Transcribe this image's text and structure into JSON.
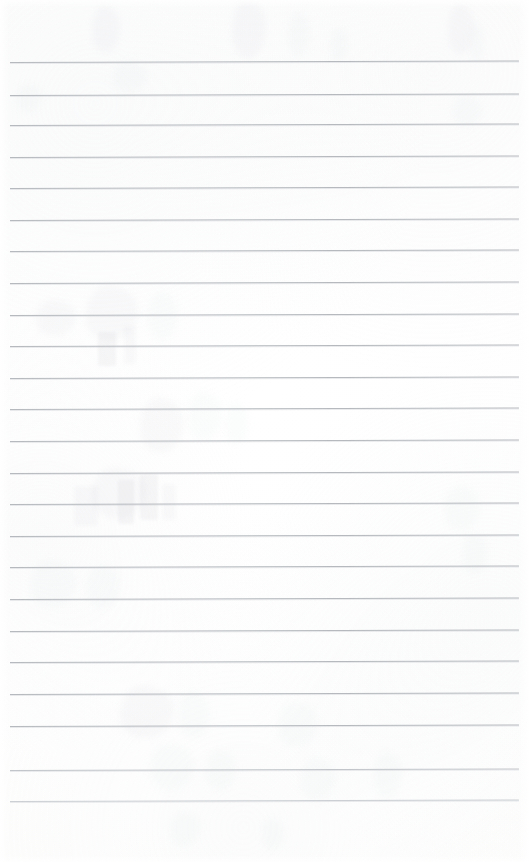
{
  "document": {
    "kind": "lined-notebook-page-scan",
    "title": "Blank Ruled Notebook Page",
    "page_width": 529,
    "page_height": 862,
    "paper_color": "#ffffff",
    "rule_color": "#b6babe",
    "content_text": "",
    "has_handwriting": false,
    "notes": "Blank ruled sheet; only faint bleed-through shadows from the reverse side are visible."
  },
  "ruling": {
    "line_count": 24,
    "first_line_y": 62,
    "last_line_y": 801,
    "spacing_px": 32.1,
    "left_margin_x": 10,
    "right_edge_x": 519,
    "line_thickness_px": 1,
    "skew_px_across_page": -1.5,
    "lines": [
      {
        "index": 1,
        "y": 62,
        "x_start": 10,
        "x_end": 519,
        "weight": "normal"
      },
      {
        "index": 2,
        "y": 95,
        "x_start": 10,
        "x_end": 519,
        "weight": "normal"
      },
      {
        "index": 3,
        "y": 125,
        "x_start": 10,
        "x_end": 519,
        "weight": "normal"
      },
      {
        "index": 4,
        "y": 157,
        "x_start": 10,
        "x_end": 519,
        "weight": "normal"
      },
      {
        "index": 5,
        "y": 188,
        "x_start": 10,
        "x_end": 519,
        "weight": "normal"
      },
      {
        "index": 6,
        "y": 220,
        "x_start": 10,
        "x_end": 519,
        "weight": "normal"
      },
      {
        "index": 7,
        "y": 251,
        "x_start": 10,
        "x_end": 519,
        "weight": "normal"
      },
      {
        "index": 8,
        "y": 283,
        "x_start": 10,
        "x_end": 519,
        "weight": "normal"
      },
      {
        "index": 9,
        "y": 315,
        "x_start": 10,
        "x_end": 519,
        "weight": "normal"
      },
      {
        "index": 10,
        "y": 346,
        "x_start": 10,
        "x_end": 519,
        "weight": "normal"
      },
      {
        "index": 11,
        "y": 378,
        "x_start": 10,
        "x_end": 519,
        "weight": "normal"
      },
      {
        "index": 12,
        "y": 409,
        "x_start": 10,
        "x_end": 519,
        "weight": "normal"
      },
      {
        "index": 13,
        "y": 441,
        "x_start": 10,
        "x_end": 519,
        "weight": "normal"
      },
      {
        "index": 14,
        "y": 473,
        "x_start": 10,
        "x_end": 519,
        "weight": "normal"
      },
      {
        "index": 15,
        "y": 504,
        "x_start": 10,
        "x_end": 519,
        "weight": "normal"
      },
      {
        "index": 16,
        "y": 536,
        "x_start": 10,
        "x_end": 519,
        "weight": "normal"
      },
      {
        "index": 17,
        "y": 567,
        "x_start": 10,
        "x_end": 519,
        "weight": "normal"
      },
      {
        "index": 18,
        "y": 599,
        "x_start": 10,
        "x_end": 519,
        "weight": "normal"
      },
      {
        "index": 19,
        "y": 631,
        "x_start": 10,
        "x_end": 519,
        "weight": "normal"
      },
      {
        "index": 20,
        "y": 662,
        "x_start": 10,
        "x_end": 519,
        "weight": "normal"
      },
      {
        "index": 21,
        "y": 694,
        "x_start": 10,
        "x_end": 519,
        "weight": "normal"
      },
      {
        "index": 22,
        "y": 726,
        "x_start": 10,
        "x_end": 519,
        "weight": "normal"
      },
      {
        "index": 23,
        "y": 770,
        "x_start": 10,
        "x_end": 519,
        "weight": "light"
      },
      {
        "index": 24,
        "y": 801,
        "x_start": 10,
        "x_end": 519,
        "weight": "lighter"
      }
    ]
  },
  "bleed_through": {
    "description": "Faint ghost impressions of handwriting from the opposite side of the sheet",
    "marks": [
      {
        "x": 92,
        "y": 6,
        "w": 28,
        "h": 46,
        "kind": "soft"
      },
      {
        "x": 232,
        "y": 0,
        "w": 34,
        "h": 58,
        "kind": "soft"
      },
      {
        "x": 288,
        "y": 12,
        "w": 22,
        "h": 44,
        "kind": "faint"
      },
      {
        "x": 330,
        "y": 28,
        "w": 18,
        "h": 34,
        "kind": "faint"
      },
      {
        "x": 448,
        "y": 4,
        "w": 26,
        "h": 50,
        "kind": "soft"
      },
      {
        "x": 470,
        "y": 22,
        "w": 14,
        "h": 40,
        "kind": "faint"
      },
      {
        "x": 112,
        "y": 62,
        "w": 36,
        "h": 30,
        "kind": "faint"
      },
      {
        "x": 16,
        "y": 84,
        "w": 26,
        "h": 28,
        "kind": "faint"
      },
      {
        "x": 452,
        "y": 96,
        "w": 30,
        "h": 30,
        "kind": "faint"
      },
      {
        "x": 36,
        "y": 300,
        "w": 40,
        "h": 36,
        "kind": "soft"
      },
      {
        "x": 86,
        "y": 286,
        "w": 52,
        "h": 54,
        "kind": "soft"
      },
      {
        "x": 148,
        "y": 292,
        "w": 30,
        "h": 48,
        "kind": "faint"
      },
      {
        "x": 98,
        "y": 332,
        "w": 18,
        "h": 34,
        "kind": "stroke"
      },
      {
        "x": 124,
        "y": 326,
        "w": 12,
        "h": 38,
        "kind": "stroke-faint"
      },
      {
        "x": 140,
        "y": 398,
        "w": 44,
        "h": 54,
        "kind": "soft"
      },
      {
        "x": 188,
        "y": 392,
        "w": 34,
        "h": 48,
        "kind": "faint"
      },
      {
        "x": 226,
        "y": 404,
        "w": 22,
        "h": 40,
        "kind": "faint"
      },
      {
        "x": 92,
        "y": 468,
        "w": 54,
        "h": 50,
        "kind": "soft"
      },
      {
        "x": 74,
        "y": 486,
        "w": 24,
        "h": 40,
        "kind": "stroke-faint"
      },
      {
        "x": 118,
        "y": 480,
        "w": 16,
        "h": 44,
        "kind": "stroke"
      },
      {
        "x": 140,
        "y": 474,
        "w": 18,
        "h": 46,
        "kind": "stroke"
      },
      {
        "x": 162,
        "y": 484,
        "w": 14,
        "h": 36,
        "kind": "stroke-faint"
      },
      {
        "x": 30,
        "y": 560,
        "w": 46,
        "h": 48,
        "kind": "faint"
      },
      {
        "x": 86,
        "y": 566,
        "w": 34,
        "h": 42,
        "kind": "faint"
      },
      {
        "x": 444,
        "y": 486,
        "w": 36,
        "h": 44,
        "kind": "faint"
      },
      {
        "x": 462,
        "y": 534,
        "w": 26,
        "h": 40,
        "kind": "faint"
      },
      {
        "x": 120,
        "y": 686,
        "w": 54,
        "h": 52,
        "kind": "soft"
      },
      {
        "x": 178,
        "y": 692,
        "w": 32,
        "h": 46,
        "kind": "faint"
      },
      {
        "x": 278,
        "y": 702,
        "w": 40,
        "h": 44,
        "kind": "faint"
      },
      {
        "x": 150,
        "y": 744,
        "w": 44,
        "h": 46,
        "kind": "faint"
      },
      {
        "x": 206,
        "y": 750,
        "w": 30,
        "h": 40,
        "kind": "faint"
      },
      {
        "x": 300,
        "y": 758,
        "w": 36,
        "h": 42,
        "kind": "faint"
      },
      {
        "x": 374,
        "y": 752,
        "w": 28,
        "h": 46,
        "kind": "faint"
      },
      {
        "x": 170,
        "y": 812,
        "w": 30,
        "h": 34,
        "kind": "faint"
      },
      {
        "x": 262,
        "y": 818,
        "w": 22,
        "h": 32,
        "kind": "faint"
      }
    ]
  }
}
